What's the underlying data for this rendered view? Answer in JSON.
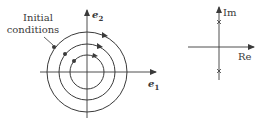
{
  "phase_portrait": {
    "annotation": [
      "Initial",
      "conditions"
    ],
    "axis_x_label": "e",
    "axis_x_subscript": "1",
    "axis_y_label": "e",
    "axis_y_subscript": "2",
    "center": [
      87,
      72
    ],
    "radii": [
      17,
      28,
      40
    ],
    "initial_points": [
      {
        "x": 74,
        "y": 61
      },
      {
        "x": 65,
        "y": 54
      },
      {
        "x": 54,
        "y": 47
      }
    ],
    "trajectory_direction": "clockwise"
  },
  "pole_plot": {
    "x_axis_label": "Re",
    "y_axis_label": "Im",
    "poles": [
      {
        "x": 219,
        "y": 22,
        "marker": "x"
      },
      {
        "x": 219,
        "y": 71,
        "marker": "x"
      }
    ],
    "pole_description": "complex-conjugate poles on imaginary axis"
  },
  "colors": {
    "line": "#3a3a3a",
    "background": "#ffffff"
  }
}
